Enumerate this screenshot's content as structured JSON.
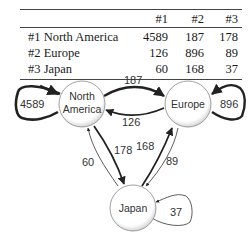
{
  "table": {
    "headers": [
      "",
      "#1",
      "#2",
      "#3"
    ],
    "rows": [
      {
        "label": "#1 North America",
        "values": [
          "4589",
          "187",
          "178"
        ]
      },
      {
        "label": "#2 Europe",
        "values": [
          "126",
          "896",
          "89"
        ]
      },
      {
        "label": "#3 Japan",
        "values": [
          "60",
          "168",
          "37"
        ]
      }
    ]
  },
  "graph": {
    "nodes": [
      {
        "id": "na",
        "label_line1": "North",
        "label_line2": "America"
      },
      {
        "id": "eu",
        "label": "Europe"
      },
      {
        "id": "jp",
        "label": "Japan"
      }
    ],
    "edges": [
      {
        "from": "North America",
        "to": "North America",
        "weight": "4589"
      },
      {
        "from": "North America",
        "to": "Europe",
        "weight": "187"
      },
      {
        "from": "North America",
        "to": "Japan",
        "weight": "178"
      },
      {
        "from": "Europe",
        "to": "North America",
        "weight": "126"
      },
      {
        "from": "Europe",
        "to": "Europe",
        "weight": "896"
      },
      {
        "from": "Europe",
        "to": "Japan",
        "weight": "89"
      },
      {
        "from": "Japan",
        "to": "North America",
        "weight": "60"
      },
      {
        "from": "Japan",
        "to": "Europe",
        "weight": "168"
      },
      {
        "from": "Japan",
        "to": "Japan",
        "weight": "37"
      }
    ]
  }
}
